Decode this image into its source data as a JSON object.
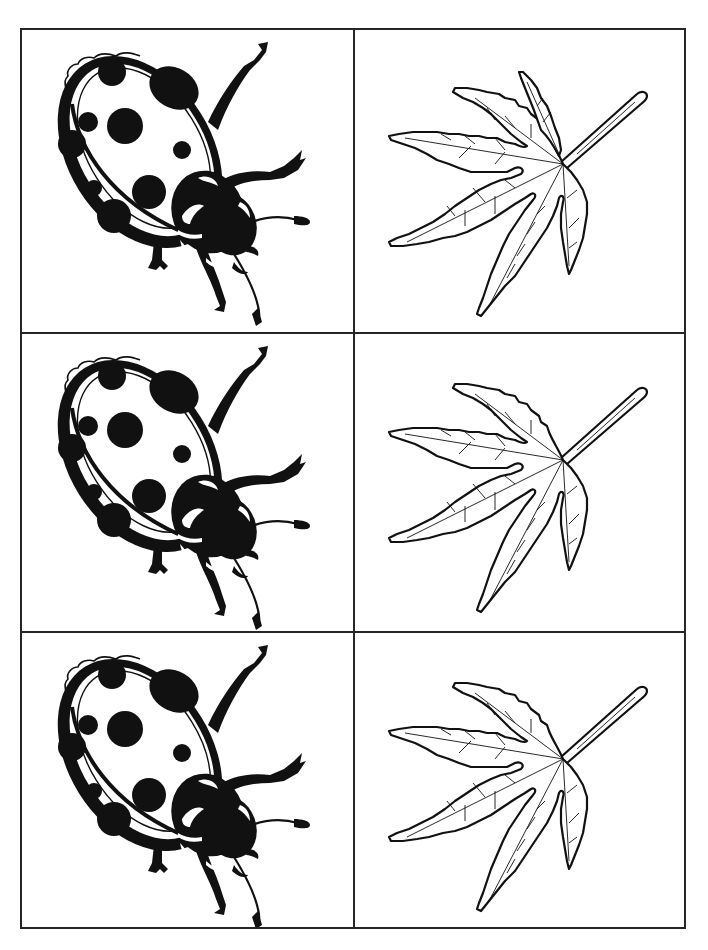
{
  "sheet": {
    "layout": {
      "columns": 2,
      "rows": 3
    },
    "border_color": "#262626",
    "ink_color": "#111111",
    "paper_color": "#ffffff",
    "cards": [
      {
        "row": 0,
        "col": 0,
        "image": "ladybug-illustration",
        "label": "Ladybug"
      },
      {
        "row": 0,
        "col": 1,
        "image": "maple-leaf-illustration",
        "label": "Maple leaf"
      },
      {
        "row": 1,
        "col": 0,
        "image": "ladybug-illustration",
        "label": "Ladybug"
      },
      {
        "row": 1,
        "col": 1,
        "image": "maple-leaf-illustration",
        "label": "Maple leaf"
      },
      {
        "row": 2,
        "col": 0,
        "image": "ladybug-illustration",
        "label": "Ladybug"
      },
      {
        "row": 2,
        "col": 1,
        "image": "maple-leaf-illustration",
        "label": "Maple leaf"
      }
    ]
  }
}
